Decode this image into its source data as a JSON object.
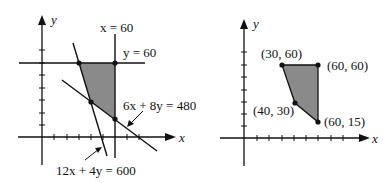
{
  "left_plot": {
    "x_axis_label": "x",
    "y_axis_label": "y",
    "lines": [
      {
        "label": "x = 60"
      },
      {
        "label": "y = 60"
      },
      {
        "label": "6x + 8y = 480"
      },
      {
        "label": "12x + 4y = 600"
      }
    ]
  },
  "right_plot": {
    "x_axis_label": "x",
    "y_axis_label": "y",
    "vertices": [
      {
        "label": "(30, 60)"
      },
      {
        "label": "(60, 60)"
      },
      {
        "label": "(40, 30)"
      },
      {
        "label": "(60, 15)"
      }
    ]
  },
  "colors": {
    "feasible_region": "#8a8a8a",
    "ink": "#111111"
  }
}
